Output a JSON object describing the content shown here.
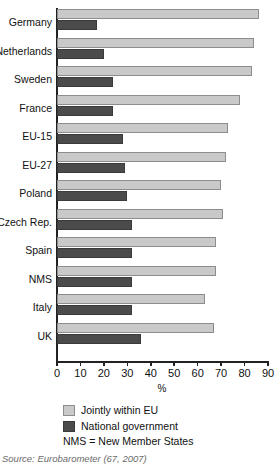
{
  "chart_data": {
    "type": "bar",
    "orientation": "horizontal",
    "title": "",
    "xlabel": "%",
    "ylabel": "",
    "xlim": [
      0,
      90
    ],
    "xticks": [
      0,
      10,
      20,
      30,
      40,
      50,
      60,
      70,
      80,
      90
    ],
    "grid": false,
    "legend_position": "below",
    "categories": [
      "Germany",
      "Netherlands",
      "Sweden",
      "France",
      "EU-15",
      "EU-27",
      "Poland",
      "Czech Rep.",
      "Spain",
      "NMS",
      "Italy",
      "UK"
    ],
    "series": [
      {
        "name": "Jointly within EU",
        "color": "#c9c9c9",
        "values": [
          86,
          84,
          83,
          78,
          73,
          72,
          70,
          71,
          68,
          68,
          63,
          67
        ]
      },
      {
        "name": "National government",
        "color": "#4b4b4b",
        "values": [
          17,
          20,
          24,
          24,
          28,
          29,
          30,
          32,
          32,
          32,
          32,
          36
        ]
      }
    ],
    "annotations": [
      "NMS = New Member States"
    ]
  },
  "legend": {
    "items": [
      {
        "label": "Jointly within EU",
        "swatch": "light"
      },
      {
        "label": "National government",
        "swatch": "dark"
      }
    ],
    "note": "NMS = New Member States"
  },
  "source": {
    "text": "Source: Eurobarometer (67, 2007)"
  }
}
